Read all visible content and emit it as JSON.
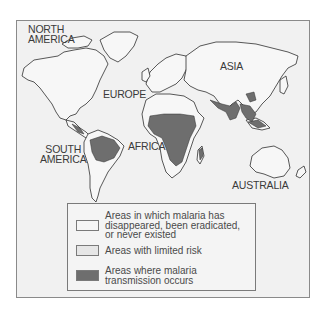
{
  "map": {
    "title": "World distribution of malaria",
    "labels": {
      "north_america": "NORTH\nAMERICA",
      "europe": "EUROPE",
      "asia": "ASIA",
      "south_america": "SOUTH\nAMERICA",
      "africa": "AFRICA",
      "australia": "AUSTRALIA"
    },
    "colors": {
      "background": "#f1f1f1",
      "land_no_malaria": "#f6f6f6",
      "land_limited_risk": "#e4e4e4",
      "land_transmission": "#6e6e6e",
      "border": "#333333"
    }
  },
  "legend": {
    "items": [
      {
        "label": "Areas in which malaria has\ndisappeared, been eradicated,\nor never existed",
        "color": "#f6f6f6"
      },
      {
        "label": "Areas with limited risk",
        "color": "#e6e6e6"
      },
      {
        "label": "Areas where malaria\ntransmission occurs",
        "color": "#6e6e6e"
      }
    ]
  }
}
